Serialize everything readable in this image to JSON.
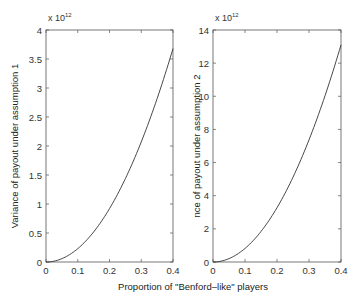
{
  "figure": {
    "shared_xlabel": "Proportion of \"Benford–like\" players"
  },
  "chart_data": [
    {
      "type": "line",
      "title": "",
      "xlabel": "Proportion of \"Benford–like\" players",
      "ylabel": "Variance of payout under assumption 1",
      "y_multiplier": "x 10^12",
      "xlim": [
        0,
        0.4
      ],
      "ylim": [
        0,
        4
      ],
      "xticks": [
        "0",
        "0.1",
        "0.2",
        "0.3",
        "0.4"
      ],
      "yticks": [
        "0",
        "0.5",
        "1",
        "1.5",
        "2",
        "2.5",
        "3",
        "3.5",
        "4"
      ],
      "grid": false,
      "series": [
        {
          "name": "assumption 1",
          "x": [
            0,
            0.05,
            0.1,
            0.15,
            0.2,
            0.25,
            0.3,
            0.35,
            0.4
          ],
          "values": [
            0,
            0.06,
            0.23,
            0.52,
            0.92,
            1.44,
            2.07,
            2.82,
            3.68
          ]
        }
      ]
    },
    {
      "type": "line",
      "title": "",
      "xlabel": "Proportion of \"Benford–like\" players",
      "ylabel": "Variance of payout under assumption 2",
      "ylabel_visible": "nce of payout under assumption 2",
      "y_multiplier": "x 10^12",
      "xlim": [
        0,
        0.4
      ],
      "ylim": [
        0,
        14
      ],
      "xticks": [
        "0",
        "0.1",
        "0.2",
        "0.3",
        "0.4"
      ],
      "yticks": [
        "0",
        "2",
        "4",
        "6",
        "8",
        "10",
        "12",
        "14"
      ],
      "grid": false,
      "series": [
        {
          "name": "assumption 2",
          "x": [
            0,
            0.05,
            0.1,
            0.15,
            0.2,
            0.25,
            0.3,
            0.35,
            0.4
          ],
          "values": [
            0,
            0.2,
            0.82,
            1.84,
            3.28,
            5.12,
            7.37,
            10.03,
            13.1
          ]
        }
      ]
    }
  ]
}
